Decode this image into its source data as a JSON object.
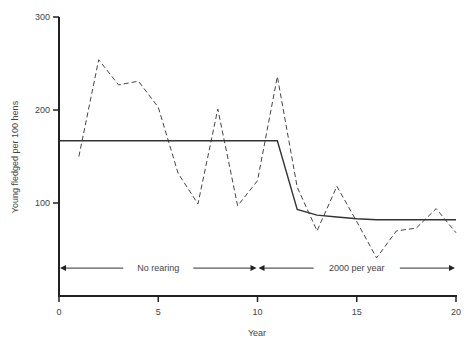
{
  "chart_data": {
    "type": "line",
    "title": "",
    "xlabel": "Year",
    "ylabel": "Young fledged per 100 hens",
    "xlim": [
      0,
      20
    ],
    "ylim": [
      0,
      300
    ],
    "x_ticks": [
      0,
      5,
      10,
      15,
      20
    ],
    "x_tick_labels": [
      "0",
      "5",
      "10",
      "15",
      "20"
    ],
    "y_ticks": [
      100,
      200,
      300
    ],
    "y_tick_labels": [
      "100",
      "200",
      "300"
    ],
    "grid": false,
    "series": [
      {
        "name": "Observed",
        "style": "dashed",
        "x": [
          1,
          2,
          3,
          4,
          5,
          6,
          7,
          8,
          9,
          10,
          11,
          12,
          13,
          14,
          15,
          16,
          17,
          18,
          19,
          20
        ],
        "values": [
          150,
          254,
          227,
          231,
          203,
          132,
          99,
          201,
          97,
          124,
          236,
          117,
          70,
          118,
          80,
          41,
          70,
          73,
          94,
          68
        ]
      },
      {
        "name": "Model",
        "style": "solid",
        "x": [
          0,
          11,
          12,
          13,
          14,
          15,
          16,
          17,
          18,
          19,
          20
        ],
        "values": [
          167,
          167,
          93,
          87,
          85,
          83,
          82,
          82,
          82,
          82,
          82
        ]
      }
    ],
    "annotations": [
      {
        "label": "No rearing",
        "from": 0,
        "to": 10,
        "y": 30
      },
      {
        "label": "2000 per year",
        "from": 10,
        "to": 20,
        "y": 30
      }
    ]
  }
}
